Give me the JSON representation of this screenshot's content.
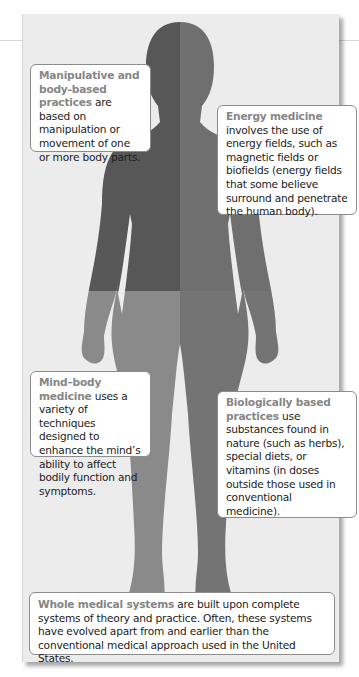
{
  "figure": {
    "type": "body-silhouette",
    "quadrant_colors": {
      "upper_left": "#575757",
      "upper_right": "#6f6f6f",
      "lower_left": "#8a8a8a",
      "lower_right": "#747474"
    },
    "panel_background": "#ececec",
    "heading_color": "#868686"
  },
  "callouts": {
    "manipulative": {
      "heading": "Manipulative and body-based practices",
      "body": " are based on manipulation or movement of one or more body parts."
    },
    "energy": {
      "heading": "Energy medicine",
      "body": " involves the use of energy fields, such as magnetic fields or biofields (energy fields that some believe surround and penetrate the human body)."
    },
    "mind_body": {
      "heading": "Mind–body medicine",
      "body": " uses a variety of techniques designed to enhance the mind’s ability to affect bodily function and symptoms."
    },
    "biological": {
      "heading": "Biologically based practices",
      "body": " use substances found in nature (such as herbs), special diets, or vitamins (in doses outside those used in conventional medicine)."
    },
    "whole": {
      "heading": "Whole medical systems",
      "body": " are built upon complete systems of theory and practice.  Often, these systems have evolved apart from and earlier than the conventional medical approach used in the United States."
    }
  }
}
